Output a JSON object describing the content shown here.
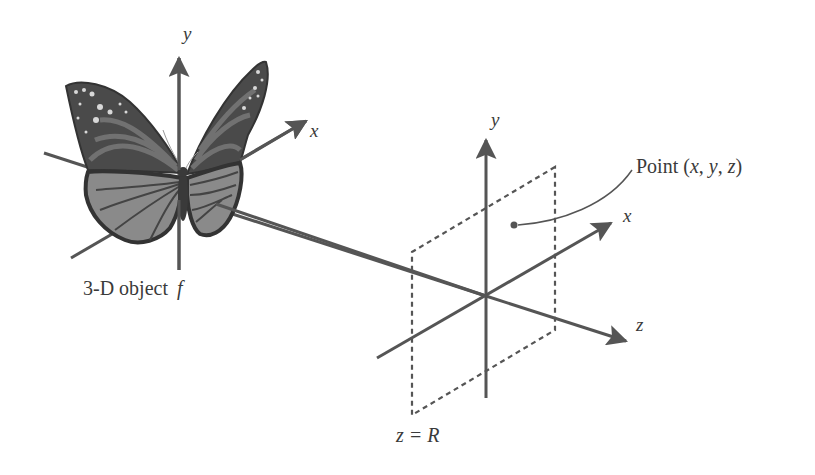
{
  "diagram": {
    "object": {
      "label": "3-D object f",
      "label_text": "3-D object ",
      "label_var": "f",
      "axes": {
        "x": "x",
        "y": "y"
      }
    },
    "viewer": {
      "axes": {
        "x": "x",
        "y": "y",
        "z": "z"
      },
      "plane_label": "z = R",
      "point_label_prefix": "Point (",
      "point_label_vars": [
        "x",
        "y",
        "z"
      ],
      "point_label_suffix": ")",
      "point_label": "Point (x, y, z)"
    },
    "colors": {
      "axis": "#555555",
      "text": "#3a3a3a",
      "wing_dark": "#3f3f3f",
      "wing_mid": "#6e6e6e",
      "wing_light": "#9a9a9a",
      "background": "#ffffff"
    }
  }
}
